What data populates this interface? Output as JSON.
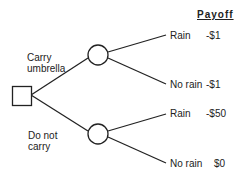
{
  "header": {
    "payoff_label": "Payoff"
  },
  "decision": {
    "options": [
      {
        "label_line1": "Carry",
        "label_line2": "umbrella",
        "outcomes": [
          {
            "label": "Rain",
            "payoff": "-$1"
          },
          {
            "label": "No rain",
            "payoff": "-$1"
          }
        ]
      },
      {
        "label_line1": "Do not",
        "label_line2": "carry",
        "outcomes": [
          {
            "label": "Rain",
            "payoff": "-$50"
          },
          {
            "label": "No rain",
            "payoff": "$0"
          }
        ]
      }
    ]
  },
  "colors": {
    "line": "#222222",
    "fill": "#ffffff"
  }
}
